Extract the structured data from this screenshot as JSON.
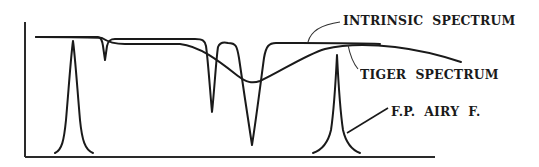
{
  "diagram": {
    "labels": {
      "intrinsic": "INTRINSIC  SPECTRUM",
      "tiger": "TIGER  SPECTRUM",
      "airy": "F.P.  AIRY  F."
    },
    "colors": {
      "line": "#1a1a1a",
      "background": "#ffffff"
    },
    "curves": [
      {
        "id": "intrinsic-spectrum",
        "description": "flat spectrum with three absorption dips (one shallow, two deep)"
      },
      {
        "id": "tiger-spectrum",
        "description": "smoothed broad dip spectrum"
      },
      {
        "id": "fp-airy-function",
        "description": "two Fabry-Perot transmission peaks"
      }
    ]
  }
}
